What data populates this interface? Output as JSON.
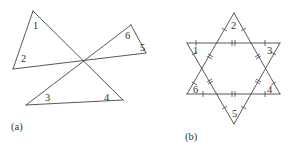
{
  "figure_a": {
    "caption": "(a)",
    "angle_labels": [
      "1",
      "2",
      "3",
      "4",
      "5",
      "6"
    ],
    "description": "Two triangles sharing a common vertex with vertical angles; angles labeled 1-6"
  },
  "figure_b": {
    "caption": "(b)",
    "angle_labels": [
      "1",
      "2",
      "3",
      "4",
      "5",
      "6"
    ],
    "description": "Six-pointed star formed by two overlapping equilateral triangles; outer segments marked with single ticks, hexagon sides marked with double ticks; star point angles labeled 1-6"
  },
  "colors": {
    "line": "#444444",
    "text": "#333333",
    "background": "#ffffff"
  }
}
